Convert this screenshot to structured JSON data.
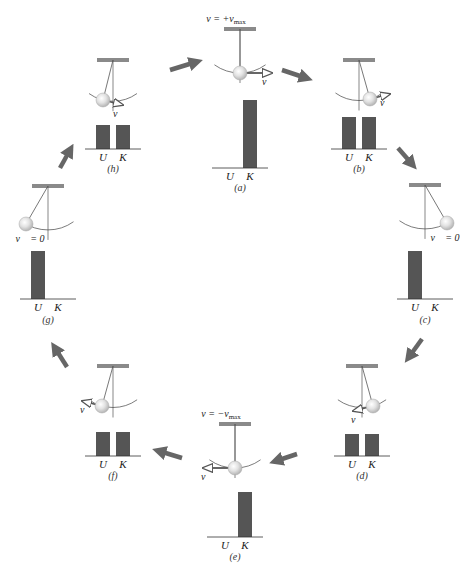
{
  "colors": {
    "bar": "#555555",
    "ceiling": "#8a8a8a",
    "string": "#555555",
    "arc": "#444444",
    "bob_fill": "#dcdcdc",
    "bob_stroke": "#aaaaaa",
    "cycle_arrow": "#666666",
    "velocity_arrow": "#555555",
    "axis": "#333333",
    "text": "#222222"
  },
  "axis_labels": {
    "u": "U",
    "k": "K"
  },
  "velocity_symbol": "v⃗",
  "panels": [
    {
      "id": "a",
      "caption": "(a)",
      "top_label": "v = +v",
      "top_sub": "max",
      "velocity_label": "v⃗",
      "zero_label": "",
      "cx": 240,
      "ceil_y": 29,
      "bob_dx": 0,
      "bob_dy": 44,
      "arrow_dir": 1,
      "arrow_len": 32,
      "bars": {
        "U": 0,
        "K": 68
      },
      "axis_y": 168,
      "caption_y": 191
    },
    {
      "id": "b",
      "caption": "(b)",
      "top_label": "",
      "top_sub": "",
      "velocity_label": "v⃗",
      "zero_label": "",
      "cx": 359,
      "ceil_y": 60,
      "bob_dx": 11,
      "bob_dy": 39,
      "arrow_dir": 1,
      "arrow_len": 20,
      "bars": {
        "U": 32,
        "K": 32
      },
      "axis_y": 149,
      "caption_y": 172
    },
    {
      "id": "c",
      "caption": "(c)",
      "top_label": "",
      "top_sub": "",
      "velocity_label": "",
      "zero_label": "v⃗ = 0",
      "cx": 425,
      "ceil_y": 185,
      "bob_dx": 22,
      "bob_dy": 38,
      "arrow_dir": 0,
      "arrow_len": 0,
      "bars": {
        "U": 48,
        "K": 0
      },
      "axis_y": 299,
      "caption_y": 323
    },
    {
      "id": "d",
      "caption": "(d)",
      "top_label": "",
      "top_sub": "",
      "velocity_label": "v⃗",
      "zero_label": "",
      "cx": 362,
      "ceil_y": 366,
      "bob_dx": 11,
      "bob_dy": 40,
      "arrow_dir": -1,
      "arrow_len": 20,
      "bars": {
        "U": 22,
        "K": 22
      },
      "axis_y": 456,
      "caption_y": 479
    },
    {
      "id": "e",
      "caption": "(e)",
      "top_label": "v = −v",
      "top_sub": "max",
      "velocity_label": "v⃗",
      "zero_label": "",
      "cx": 235,
      "ceil_y": 424,
      "bob_dx": 0,
      "bob_dy": 44,
      "arrow_dir": -1,
      "arrow_len": 32,
      "bars": {
        "U": 0,
        "K": 45
      },
      "axis_y": 537,
      "caption_y": 560
    },
    {
      "id": "f",
      "caption": "(f)",
      "top_label": "",
      "top_sub": "",
      "velocity_label": "v⃗",
      "zero_label": "",
      "cx": 113,
      "ceil_y": 366,
      "bob_dx": -11,
      "bob_dy": 40,
      "arrow_dir": -1,
      "arrow_len": 20,
      "bars": {
        "U": 24,
        "K": 24
      },
      "axis_y": 456,
      "caption_y": 479
    },
    {
      "id": "g",
      "caption": "(g)",
      "top_label": "",
      "top_sub": "",
      "velocity_label": "",
      "zero_label": "v⃗ = 0",
      "cx": 48,
      "ceil_y": 186,
      "bob_dx": -22,
      "bob_dy": 38,
      "arrow_dir": 0,
      "arrow_len": 0,
      "bars": {
        "U": 48,
        "K": 0
      },
      "axis_y": 299,
      "caption_y": 323
    },
    {
      "id": "h",
      "caption": "(h)",
      "top_label": "",
      "top_sub": "",
      "velocity_label": "v⃗",
      "zero_label": "",
      "cx": 113,
      "ceil_y": 60,
      "bob_dx": -10,
      "bob_dy": 40,
      "arrow_dir": 1,
      "arrow_len": 20,
      "bars": {
        "U": 24,
        "K": 24
      },
      "axis_y": 149,
      "caption_y": 172
    }
  ],
  "cycle_arrows": [
    {
      "from": "h",
      "to": "a",
      "x1": 170,
      "y1": 70,
      "x2": 196,
      "y2": 62
    },
    {
      "from": "a",
      "to": "b",
      "x1": 282,
      "y1": 70,
      "x2": 306,
      "y2": 78
    },
    {
      "from": "b",
      "to": "c",
      "x1": 398,
      "y1": 148,
      "x2": 412,
      "y2": 164
    },
    {
      "from": "c",
      "to": "d",
      "x1": 422,
      "y1": 339,
      "x2": 409,
      "y2": 357
    },
    {
      "from": "d",
      "to": "e",
      "x1": 297,
      "y1": 454,
      "x2": 276,
      "y2": 461
    },
    {
      "from": "e",
      "to": "f",
      "x1": 182,
      "y1": 458,
      "x2": 159,
      "y2": 451
    },
    {
      "from": "f",
      "to": "g",
      "x1": 67,
      "y1": 367,
      "x2": 55,
      "y2": 348
    },
    {
      "from": "g",
      "to": "h",
      "x1": 60,
      "y1": 168,
      "x2": 70,
      "y2": 150
    }
  ]
}
